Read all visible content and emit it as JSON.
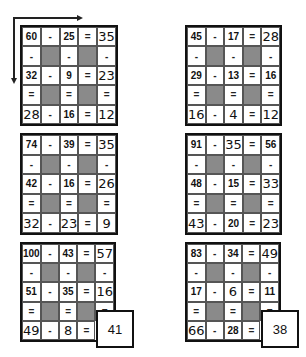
{
  "puzzles": [
    {
      "cells": [
        [
          "60",
          "-",
          "25",
          "=",
          "35"
        ],
        [
          "-",
          "",
          "-",
          "",
          "-"
        ],
        [
          "32",
          "-",
          "9",
          "=",
          "23"
        ],
        [
          "=",
          "",
          "=",
          "",
          "="
        ],
        [
          "28",
          "-",
          "16",
          "=",
          "12"
        ]
      ],
      "hand": [
        [
          0,
          4
        ],
        [
          2,
          4
        ],
        [
          4,
          0
        ],
        [
          4,
          4
        ]
      ]
    },
    {
      "cells": [
        [
          "45",
          "-",
          "17",
          "=",
          "28"
        ],
        [
          "-",
          "",
          "-",
          "",
          "-"
        ],
        [
          "29",
          "-",
          "13",
          "=",
          "16"
        ],
        [
          "=",
          "",
          "=",
          "",
          "="
        ],
        [
          "16",
          "-",
          "4",
          "=",
          "12"
        ]
      ],
      "hand": [
        [
          0,
          4
        ],
        [
          4,
          0
        ],
        [
          4,
          2
        ],
        [
          4,
          4
        ]
      ]
    },
    {
      "cells": [
        [
          "74",
          "-",
          "39",
          "=",
          "35"
        ],
        [
          "-",
          "",
          "-",
          "",
          "-"
        ],
        [
          "42",
          "-",
          "16",
          "=",
          "26"
        ],
        [
          "=",
          "",
          "=",
          "",
          "="
        ],
        [
          "32",
          "-",
          "23",
          "=",
          "9"
        ]
      ],
      "hand": [
        [
          0,
          4
        ],
        [
          2,
          4
        ],
        [
          4,
          0
        ],
        [
          4,
          2
        ],
        [
          4,
          4
        ]
      ]
    },
    {
      "cells": [
        [
          "91",
          "-",
          "35",
          "=",
          "56"
        ],
        [
          "-",
          "",
          "-",
          "",
          "-"
        ],
        [
          "48",
          "-",
          "15",
          "=",
          "33"
        ],
        [
          "=",
          "",
          "=",
          "",
          "="
        ],
        [
          "43",
          "-",
          "20",
          "=",
          "23"
        ]
      ],
      "hand": [
        [
          0,
          2
        ],
        [
          2,
          4
        ],
        [
          4,
          0
        ],
        [
          4,
          4
        ]
      ]
    },
    {
      "cells": [
        [
          "100",
          "-",
          "43",
          "=",
          "57"
        ],
        [
          "-",
          "",
          "-",
          "",
          "-"
        ],
        [
          "51",
          "-",
          "35",
          "=",
          "16"
        ],
        [
          "=",
          "",
          "=",
          "",
          "="
        ],
        [
          "49",
          "-",
          "8",
          "=",
          ""
        ]
      ],
      "hand": [
        [
          0,
          4
        ],
        [
          2,
          4
        ],
        [
          4,
          0
        ],
        [
          4,
          2
        ]
      ],
      "answer": "41"
    },
    {
      "cells": [
        [
          "83",
          "-",
          "34",
          "=",
          "49"
        ],
        [
          "-",
          "",
          "-",
          "",
          "-"
        ],
        [
          "17",
          "-",
          "6",
          "=",
          "11"
        ],
        [
          "=",
          "",
          "=",
          "",
          "="
        ],
        [
          "66",
          "-",
          "28",
          "=",
          ""
        ]
      ],
      "hand": [
        [
          0,
          4
        ],
        [
          2,
          2
        ],
        [
          4,
          0
        ]
      ],
      "answer": "38"
    }
  ],
  "colors": {
    "shade": "#8a8a8a",
    "border": "#111111"
  }
}
